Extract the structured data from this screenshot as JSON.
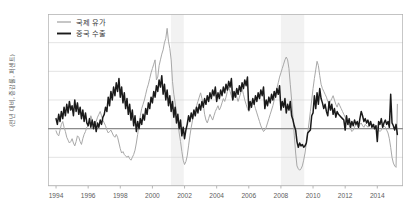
{
  "chart_data": {
    "type": "line",
    "title": "",
    "subtitle": "",
    "xlabel": "",
    "ylabel": "(전년 대비, 증감률, 퍼센트)",
    "xlim": [
      1993.5,
      2015.6
    ],
    "ylim": [
      -80,
      160
    ],
    "yticks": [
      160,
      120,
      80,
      40,
      0,
      -40,
      -80
    ],
    "ytick_labels": [
      "160",
      "120",
      "80",
      "40",
      "0",
      "−40",
      "−80"
    ],
    "xticks": [
      1994,
      1996,
      1998,
      2000,
      2002,
      2004,
      2006,
      2008,
      2010,
      2012,
      2014
    ],
    "xtick_labels": [
      "1994",
      "1996",
      "1998",
      "2000",
      "2002",
      "2004",
      "2006",
      "2008",
      "2010",
      "2012",
      "2014"
    ],
    "grid": true,
    "grid_axis": "y",
    "grid_color": "#d9d9d9",
    "zero_line": 0,
    "zero_line_color": "#8c8c8c",
    "legend_position": "top-left",
    "shaded_bands": [
      {
        "label": "",
        "x0": 2001.15,
        "x1": 2001.95,
        "color": "#f2f2f2"
      },
      {
        "label": "",
        "x0": 2008.0,
        "x1": 2009.45,
        "color": "#f2f2f2"
      }
    ],
    "series": [
      {
        "name": "국제 유가",
        "color": "#a8a8a8",
        "width": 1.0,
        "x": [
          1994.0,
          1994.083,
          1994.167,
          1994.25,
          1994.333,
          1994.417,
          1994.5,
          1994.583,
          1994.667,
          1994.75,
          1994.833,
          1994.917,
          1995.0,
          1995.083,
          1995.167,
          1995.25,
          1995.333,
          1995.417,
          1995.5,
          1995.583,
          1995.667,
          1995.75,
          1995.833,
          1995.917,
          1996.0,
          1996.083,
          1996.167,
          1996.25,
          1996.333,
          1996.417,
          1996.5,
          1996.583,
          1996.667,
          1996.75,
          1996.833,
          1996.917,
          1997.0,
          1997.083,
          1997.167,
          1997.25,
          1997.333,
          1997.417,
          1997.5,
          1997.583,
          1997.667,
          1997.75,
          1997.833,
          1997.917,
          1998.0,
          1998.083,
          1998.167,
          1998.25,
          1998.333,
          1998.417,
          1998.5,
          1998.583,
          1998.667,
          1998.75,
          1998.833,
          1998.917,
          1999.0,
          1999.083,
          1999.167,
          1999.25,
          1999.333,
          1999.417,
          1999.5,
          1999.583,
          1999.667,
          1999.75,
          1999.833,
          1999.917,
          2000.0,
          2000.083,
          2000.167,
          2000.25,
          2000.333,
          2000.417,
          2000.5,
          2000.583,
          2000.667,
          2000.75,
          2000.833,
          2000.917,
          2001.0,
          2001.083,
          2001.167,
          2001.25,
          2001.333,
          2001.417,
          2001.5,
          2001.583,
          2001.667,
          2001.75,
          2001.833,
          2001.917,
          2002.0,
          2002.083,
          2002.167,
          2002.25,
          2002.333,
          2002.417,
          2002.5,
          2002.583,
          2002.667,
          2002.75,
          2002.833,
          2002.917,
          2003.0,
          2003.083,
          2003.167,
          2003.25,
          2003.333,
          2003.417,
          2003.5,
          2003.583,
          2003.667,
          2003.75,
          2003.833,
          2003.917,
          2004.0,
          2004.083,
          2004.167,
          2004.25,
          2004.333,
          2004.417,
          2004.5,
          2004.583,
          2004.667,
          2004.75,
          2004.833,
          2004.917,
          2005.0,
          2005.083,
          2005.167,
          2005.25,
          2005.333,
          2005.417,
          2005.5,
          2005.583,
          2005.667,
          2005.75,
          2005.833,
          2005.917,
          2006.0,
          2006.083,
          2006.167,
          2006.25,
          2006.333,
          2006.417,
          2006.5,
          2006.583,
          2006.667,
          2006.75,
          2006.833,
          2006.917,
          2007.0,
          2007.083,
          2007.167,
          2007.25,
          2007.333,
          2007.417,
          2007.5,
          2007.583,
          2007.667,
          2007.75,
          2007.833,
          2007.917,
          2008.0,
          2008.083,
          2008.167,
          2008.25,
          2008.333,
          2008.417,
          2008.5,
          2008.583,
          2008.667,
          2008.75,
          2008.833,
          2008.917,
          2009.0,
          2009.083,
          2009.167,
          2009.25,
          2009.333,
          2009.417,
          2009.5,
          2009.583,
          2009.667,
          2009.75,
          2009.833,
          2009.917,
          2010.0,
          2010.083,
          2010.167,
          2010.25,
          2010.333,
          2010.417,
          2010.5,
          2010.583,
          2010.667,
          2010.75,
          2010.833,
          2010.917,
          2011.0,
          2011.083,
          2011.167,
          2011.25,
          2011.333,
          2011.417,
          2011.5,
          2011.583,
          2011.667,
          2011.75,
          2011.833,
          2011.917,
          2012.0,
          2012.083,
          2012.167,
          2012.25,
          2012.333,
          2012.417,
          2012.5,
          2012.583,
          2012.667,
          2012.75,
          2012.833,
          2012.917,
          2013.0,
          2013.083,
          2013.167,
          2013.25,
          2013.333,
          2013.417,
          2013.5,
          2013.583,
          2013.667,
          2013.75,
          2013.833,
          2013.917,
          2014.0,
          2014.083,
          2014.167,
          2014.25,
          2014.333,
          2014.417,
          2014.5,
          2014.583,
          2014.667,
          2014.75,
          2014.833,
          2014.917,
          2015.0,
          2015.083,
          2015.167,
          2015.25
        ],
        "values": [
          -3,
          -8,
          -10,
          -2,
          6,
          10,
          2,
          -4,
          -12,
          -16,
          -20,
          -18,
          -14,
          -20,
          -24,
          -18,
          -10,
          -12,
          -18,
          -22,
          -14,
          -8,
          -4,
          2,
          4,
          10,
          18,
          12,
          8,
          4,
          10,
          16,
          20,
          24,
          18,
          12,
          8,
          4,
          -2,
          -6,
          -4,
          -2,
          -6,
          -10,
          -12,
          -8,
          -12,
          -20,
          -28,
          -34,
          -32,
          -36,
          -38,
          -40,
          -38,
          -42,
          -44,
          -40,
          -36,
          -30,
          -20,
          -8,
          6,
          18,
          28,
          34,
          40,
          48,
          56,
          62,
          70,
          78,
          84,
          90,
          96,
          68,
          72,
          88,
          96,
          104,
          110,
          120,
          126,
          140,
          122,
          112,
          96,
          66,
          48,
          36,
          22,
          10,
          -6,
          -18,
          -32,
          -44,
          -50,
          -46,
          -38,
          -24,
          -10,
          2,
          12,
          20,
          26,
          32,
          38,
          44,
          50,
          42,
          34,
          20,
          12,
          8,
          14,
          20,
          16,
          12,
          18,
          24,
          28,
          32,
          26,
          30,
          36,
          42,
          38,
          44,
          52,
          58,
          52,
          46,
          40,
          44,
          50,
          44,
          38,
          44,
          50,
          56,
          48,
          40,
          34,
          28,
          24,
          28,
          34,
          40,
          34,
          28,
          22,
          16,
          10,
          4,
          0,
          -4,
          -2,
          2,
          8,
          14,
          20,
          26,
          32,
          40,
          48,
          56,
          64,
          72,
          78,
          84,
          90,
          96,
          100,
          96,
          84,
          62,
          40,
          16,
          -10,
          -34,
          -52,
          -56,
          -58,
          -56,
          -52,
          -44,
          -34,
          -20,
          -6,
          8,
          24,
          40,
          56,
          70,
          82,
          94,
          88,
          74,
          62,
          56,
          52,
          48,
          44,
          38,
          34,
          38,
          42,
          46,
          40,
          34,
          30,
          36,
          32,
          28,
          24,
          20,
          16,
          12,
          8,
          4,
          0,
          -4,
          -2,
          2,
          6,
          4,
          2,
          6,
          8,
          4,
          2,
          6,
          4,
          2,
          6,
          8,
          4,
          2,
          6,
          4,
          2,
          -2,
          -4,
          -2,
          2,
          4,
          2,
          -2,
          -6,
          -14,
          -26,
          -40,
          -48,
          -52,
          -54,
          34
        ]
      },
      {
        "name": "중국 수출",
        "color": "#1a1a1a",
        "width": 1.5,
        "x": [
          1994.0,
          1994.083,
          1994.167,
          1994.25,
          1994.333,
          1994.417,
          1994.5,
          1994.583,
          1994.667,
          1994.75,
          1994.833,
          1994.917,
          1995.0,
          1995.083,
          1995.167,
          1995.25,
          1995.333,
          1995.417,
          1995.5,
          1995.583,
          1995.667,
          1995.75,
          1995.833,
          1995.917,
          1996.0,
          1996.083,
          1996.167,
          1996.25,
          1996.333,
          1996.417,
          1996.5,
          1996.583,
          1996.667,
          1996.75,
          1996.833,
          1996.917,
          1997.0,
          1997.083,
          1997.167,
          1997.25,
          1997.333,
          1997.417,
          1997.5,
          1997.583,
          1997.667,
          1997.75,
          1997.833,
          1997.917,
          1998.0,
          1998.083,
          1998.167,
          1998.25,
          1998.333,
          1998.417,
          1998.5,
          1998.583,
          1998.667,
          1998.75,
          1998.833,
          1998.917,
          1999.0,
          1999.083,
          1999.167,
          1999.25,
          1999.333,
          1999.417,
          1999.5,
          1999.583,
          1999.667,
          1999.75,
          1999.833,
          1999.917,
          2000.0,
          2000.083,
          2000.167,
          2000.25,
          2000.333,
          2000.417,
          2000.5,
          2000.583,
          2000.667,
          2000.75,
          2000.833,
          2000.917,
          2001.0,
          2001.083,
          2001.167,
          2001.25,
          2001.333,
          2001.417,
          2001.5,
          2001.583,
          2001.667,
          2001.75,
          2001.833,
          2001.917,
          2002.0,
          2002.083,
          2002.167,
          2002.25,
          2002.333,
          2002.417,
          2002.5,
          2002.583,
          2002.667,
          2002.75,
          2002.833,
          2002.917,
          2003.0,
          2003.083,
          2003.167,
          2003.25,
          2003.333,
          2003.417,
          2003.5,
          2003.583,
          2003.667,
          2003.75,
          2003.833,
          2003.917,
          2004.0,
          2004.083,
          2004.167,
          2004.25,
          2004.333,
          2004.417,
          2004.5,
          2004.583,
          2004.667,
          2004.75,
          2004.833,
          2004.917,
          2005.0,
          2005.083,
          2005.167,
          2005.25,
          2005.333,
          2005.417,
          2005.5,
          2005.583,
          2005.667,
          2005.75,
          2005.833,
          2005.917,
          2006.0,
          2006.083,
          2006.167,
          2006.25,
          2006.333,
          2006.417,
          2006.5,
          2006.583,
          2006.667,
          2006.75,
          2006.833,
          2006.917,
          2007.0,
          2007.083,
          2007.167,
          2007.25,
          2007.333,
          2007.417,
          2007.5,
          2007.583,
          2007.667,
          2007.75,
          2007.833,
          2007.917,
          2008.0,
          2008.083,
          2008.167,
          2008.25,
          2008.333,
          2008.417,
          2008.5,
          2008.583,
          2008.667,
          2008.75,
          2008.833,
          2008.917,
          2009.0,
          2009.083,
          2009.167,
          2009.25,
          2009.333,
          2009.417,
          2009.5,
          2009.583,
          2009.667,
          2009.75,
          2009.833,
          2009.917,
          2010.0,
          2010.083,
          2010.167,
          2010.25,
          2010.333,
          2010.417,
          2010.5,
          2010.583,
          2010.667,
          2010.75,
          2010.833,
          2010.917,
          2011.0,
          2011.083,
          2011.167,
          2011.25,
          2011.333,
          2011.417,
          2011.5,
          2011.583,
          2011.667,
          2011.75,
          2011.833,
          2011.917,
          2012.0,
          2012.083,
          2012.167,
          2012.25,
          2012.333,
          2012.417,
          2012.5,
          2012.583,
          2012.667,
          2012.75,
          2012.833,
          2012.917,
          2013.0,
          2013.083,
          2013.167,
          2013.25,
          2013.333,
          2013.417,
          2013.5,
          2013.583,
          2013.667,
          2013.75,
          2013.833,
          2013.917,
          2014.0,
          2014.083,
          2014.167,
          2014.25,
          2014.333,
          2014.417,
          2014.5,
          2014.583,
          2014.667,
          2014.75,
          2014.833,
          2014.917,
          2015.0,
          2015.083,
          2015.167,
          2015.25
        ],
        "values": [
          14,
          6,
          20,
          10,
          24,
          14,
          30,
          18,
          34,
          22,
          38,
          26,
          32,
          18,
          40,
          24,
          36,
          20,
          30,
          14,
          26,
          10,
          22,
          8,
          4,
          14,
          2,
          12,
          0,
          10,
          -4,
          8,
          2,
          12,
          6,
          16,
          20,
          30,
          24,
          44,
          32,
          52,
          40,
          58,
          46,
          64,
          52,
          70,
          44,
          58,
          36,
          50,
          28,
          42,
          20,
          34,
          12,
          26,
          4,
          18,
          -4,
          10,
          0,
          14,
          6,
          20,
          12,
          28,
          20,
          36,
          28,
          44,
          36,
          52,
          44,
          60,
          52,
          68,
          58,
          74,
          48,
          62,
          40,
          54,
          32,
          46,
          24,
          38,
          16,
          30,
          8,
          20,
          0,
          12,
          -10,
          2,
          -14,
          -2,
          6,
          18,
          10,
          22,
          14,
          26,
          18,
          30,
          22,
          34,
          26,
          38,
          30,
          42,
          34,
          46,
          38,
          50,
          42,
          54,
          46,
          58,
          38,
          50,
          42,
          54,
          46,
          58,
          50,
          62,
          54,
          66,
          58,
          70,
          40,
          52,
          44,
          56,
          48,
          60,
          52,
          64,
          56,
          68,
          60,
          72,
          26,
          38,
          30,
          42,
          34,
          46,
          38,
          50,
          42,
          54,
          46,
          58,
          28,
          40,
          32,
          44,
          36,
          48,
          40,
          52,
          44,
          56,
          48,
          60,
          26,
          38,
          30,
          42,
          22,
          34,
          26,
          38,
          18,
          12,
          4,
          -2,
          -18,
          -26,
          -20,
          -24,
          -22,
          -26,
          -24,
          -20,
          -6,
          -4,
          -2,
          18,
          22,
          46,
          28,
          50,
          34,
          56,
          42,
          36,
          28,
          34,
          24,
          18,
          38,
          26,
          34,
          20,
          28,
          16,
          24,
          20,
          18,
          16,
          14,
          12,
          -2,
          18,
          6,
          14,
          2,
          10,
          4,
          12,
          6,
          10,
          2,
          14,
          24,
          18,
          10,
          14,
          8,
          12,
          4,
          10,
          2,
          6,
          0,
          4,
          -18,
          10,
          6,
          14,
          2,
          8,
          12,
          6,
          10,
          2,
          48,
          8,
          4,
          -2,
          6,
          -8
        ]
      }
    ]
  },
  "legend": {
    "items": [
      {
        "label": "국제 유가",
        "color": "#a8a8a8"
      },
      {
        "label": "중국 수출",
        "color": "#1a1a1a"
      }
    ]
  }
}
